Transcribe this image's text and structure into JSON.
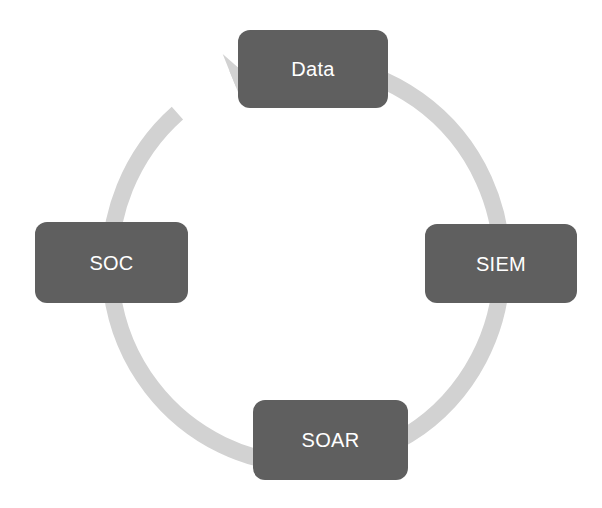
{
  "diagram": {
    "type": "cycle",
    "background_color": "#ffffff",
    "ring": {
      "color": "#d2d2d2",
      "stroke_width": 17,
      "center_x": 306,
      "center_y": 264,
      "radius_x": 196,
      "radius_y": 200,
      "direction": "clockwise",
      "arrowhead_position": "top-left",
      "arrowhead_target": "Data"
    },
    "node_style": {
      "fill_color": "#5f5f5f",
      "text_color": "#ffffff",
      "corner_radius": 12
    },
    "nodes": [
      {
        "id": "data",
        "label": "Data",
        "position": "top"
      },
      {
        "id": "siem",
        "label": "SIEM",
        "position": "right"
      },
      {
        "id": "soar",
        "label": "SOAR",
        "position": "bottom"
      },
      {
        "id": "soc",
        "label": "SOC",
        "position": "left"
      }
    ]
  }
}
